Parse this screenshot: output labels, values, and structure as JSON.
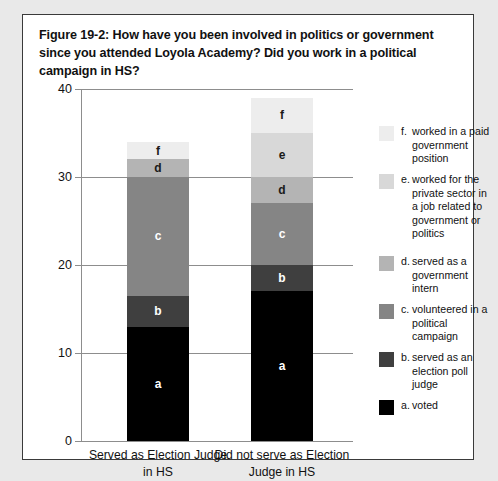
{
  "figure": {
    "caption": "Figure 19-2:  How have you been involved in politics or government since you attended Loyola Academy? Did you work in a political campaign in HS?"
  },
  "legend": {
    "items": [
      {
        "key": "f.",
        "label": "worked in a paid government position",
        "color": "#ededed"
      },
      {
        "key": "e.",
        "label": "worked for the private sector in a job related to government or politics",
        "color": "#d8d8d8"
      },
      {
        "key": "d.",
        "label": "served as a government intern",
        "color": "#b4b4b4"
      },
      {
        "key": "c.",
        "label": "volunteered in a political campaign",
        "color": "#858585"
      },
      {
        "key": "b.",
        "label": "served as an election poll judge",
        "color": "#3f3f3f"
      },
      {
        "key": "a.",
        "label": "voted",
        "color": "#000000"
      }
    ]
  },
  "chart_data": {
    "type": "bar",
    "subtype": "stacked-vertical",
    "title": "Figure 19-2:  How have you been involved in politics or government since you attended Loyola Academy? Did you work in a political campaign in HS?",
    "xlabel": "",
    "ylabel": "",
    "ylim": [
      0,
      40
    ],
    "yticks": [
      0,
      10,
      20,
      30,
      40
    ],
    "ytick_labels": [
      "0",
      "10",
      "20",
      "30",
      "40"
    ],
    "grid": true,
    "legend_position": "right",
    "categories": [
      "Served as Election Judge in HS",
      "Did not serve as Election Judge in HS"
    ],
    "series": [
      {
        "name": "a. voted",
        "key": "a",
        "color": "#000000",
        "label_color": "light",
        "values": [
          13,
          17
        ]
      },
      {
        "name": "b. served as an election poll judge",
        "key": "b",
        "color": "#3f3f3f",
        "label_color": "light",
        "values": [
          3.5,
          3
        ]
      },
      {
        "name": "c. volunteered in a political campaign",
        "key": "c",
        "color": "#858585",
        "label_color": "light",
        "values": [
          13.5,
          7
        ]
      },
      {
        "name": "d. served as a government intern",
        "key": "d",
        "color": "#b4b4b4",
        "label_color": "dark",
        "values": [
          2,
          3
        ]
      },
      {
        "name": "e. worked for the private sector in a job related to government or politics",
        "key": "e",
        "color": "#d8d8d8",
        "label_color": "dark",
        "values": [
          0,
          5
        ]
      },
      {
        "name": "f. worked in a paid government position",
        "key": "f",
        "color": "#ededed",
        "label_color": "dark",
        "values": [
          2,
          4
        ]
      }
    ],
    "totals": [
      34,
      39
    ]
  }
}
